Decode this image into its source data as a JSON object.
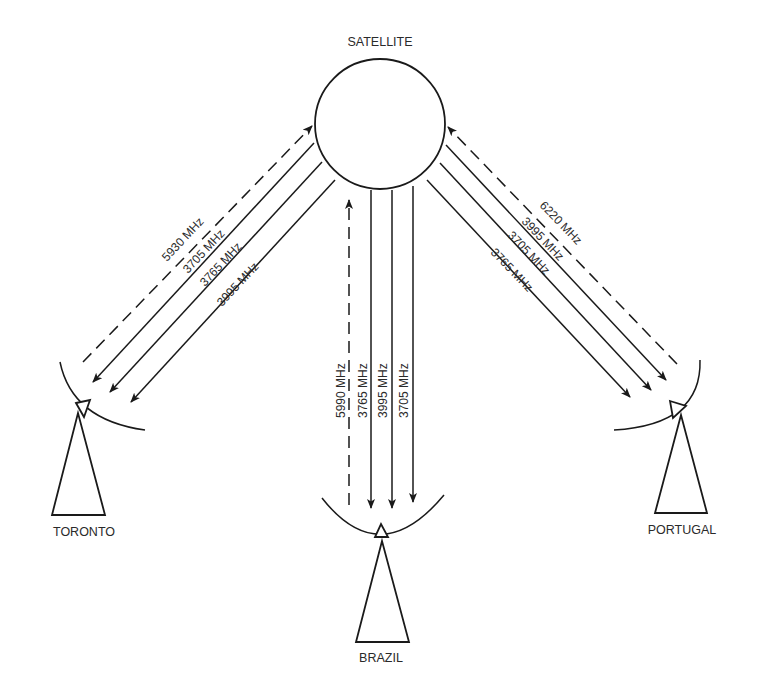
{
  "diagram": {
    "satellite": {
      "label": "SATELLITE"
    },
    "stations": {
      "toronto": {
        "label": "TORONTO",
        "uplink": "5930 MHz",
        "downlinks": [
          "3705 MHz",
          "3765 MHz",
          "3995 MHz"
        ]
      },
      "brazil": {
        "label": "BRAZIL",
        "uplink": "5990 MHz",
        "downlinks": [
          "3765 MHz",
          "3995 MHz",
          "3705 MHz"
        ]
      },
      "portugal": {
        "label": "PORTUGAL",
        "uplink": "6220 MHz",
        "downlinks": [
          "3995 MHz",
          "3705 MHz",
          "3765 MHz"
        ]
      }
    },
    "legend_hint": {
      "dashed": "uplink (earth station to satellite)",
      "solid": "downlink (satellite to earth station)"
    },
    "colors": {
      "line": "#1a1a1a",
      "text": "#2a2a2a",
      "background": "#ffffff"
    }
  }
}
